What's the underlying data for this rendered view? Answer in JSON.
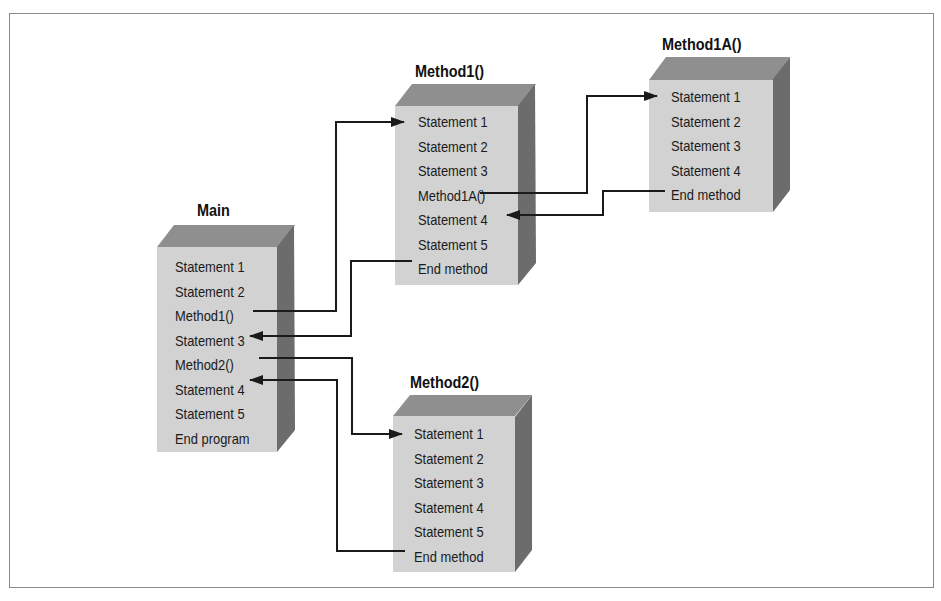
{
  "diagram": {
    "type": "call-flow",
    "boxes": {
      "main": {
        "title": "Main",
        "lines": [
          "Statement 1",
          "Statement 2",
          "Method1()",
          "Statement 3",
          "Method2()",
          "Statement 4",
          "Statement 5",
          "End program"
        ]
      },
      "method1": {
        "title": "Method1()",
        "lines": [
          "Statement 1",
          "Statement 2",
          "Statement 3",
          "Method1A()",
          "Statement 4",
          "Statement 5",
          "End method"
        ]
      },
      "method1a": {
        "title": "Method1A()",
        "lines": [
          "Statement 1",
          "Statement 2",
          "Statement 3",
          "Statement 4",
          "End method"
        ]
      },
      "method2": {
        "title": "Method2()",
        "lines": [
          "Statement 1",
          "Statement 2",
          "Statement 3",
          "Statement 4",
          "Statement 5",
          "End method"
        ]
      }
    },
    "edges": [
      {
        "from": "Main.Method1()",
        "to": "Method1().Statement 1",
        "kind": "call"
      },
      {
        "from": "Method1().End method",
        "to": "Main.Statement 3",
        "kind": "return"
      },
      {
        "from": "Method1().Method1A()",
        "to": "Method1A().Statement 1",
        "kind": "call"
      },
      {
        "from": "Method1A().End method",
        "to": "Method1().Statement 4",
        "kind": "return"
      },
      {
        "from": "Main.Method2()",
        "to": "Method2().Statement 1",
        "kind": "call"
      },
      {
        "from": "Method2().End method",
        "to": "Main.Statement 4",
        "kind": "return"
      }
    ],
    "colors": {
      "front": "#d2d2d2",
      "top": "#8f8f8f",
      "side": "#6c6c6c",
      "line": "#1a1a1a",
      "frame": "#8a8a8a"
    }
  }
}
